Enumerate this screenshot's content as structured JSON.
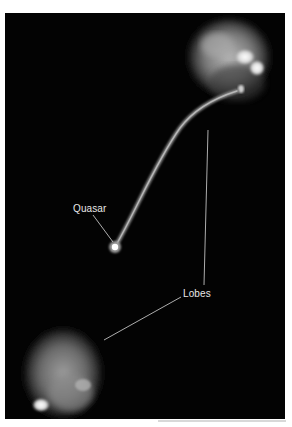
{
  "figure": {
    "background_color": "#030303",
    "labels": {
      "quasar": "Quasar",
      "lobes": "Lobes"
    },
    "features": [
      {
        "name": "quasar",
        "description": "bright compact point source"
      },
      {
        "name": "jet",
        "description": "narrow curved jet from quasar to upper lobe"
      },
      {
        "name": "upper-lobe",
        "description": "bright diffuse radio lobe, upper right"
      },
      {
        "name": "lower-lobe",
        "description": "diffuse radio lobe, lower left"
      }
    ]
  }
}
